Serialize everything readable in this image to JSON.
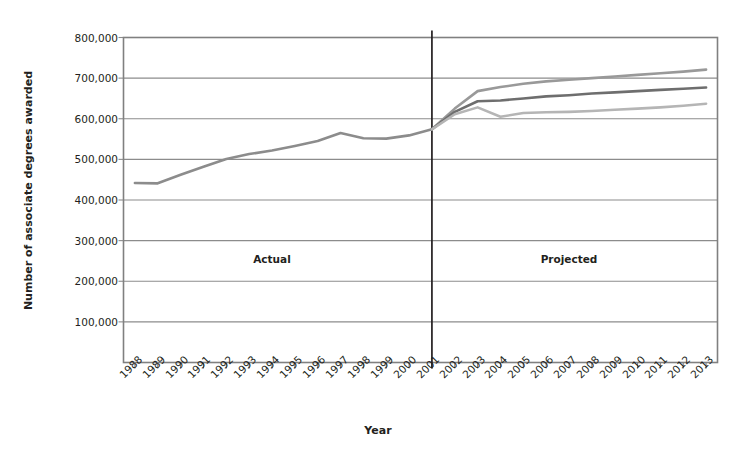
{
  "chart_data": {
    "type": "line",
    "title": "",
    "xlabel": "Year",
    "ylabel": "Number of associate degrees awarded",
    "ylim": [
      0,
      800000
    ],
    "ytick_labels": [
      "800,000",
      "700,000",
      "600,000",
      "500,000",
      "400,000",
      "300,000",
      "200,000",
      "100,000"
    ],
    "ytick_values": [
      800000,
      700000,
      600000,
      500000,
      400000,
      300000,
      200000,
      100000
    ],
    "grid": "horizontal",
    "legend": "none",
    "categories": [
      "1988",
      "1989",
      "1990",
      "1991",
      "1992",
      "1993",
      "1994",
      "1995",
      "1996",
      "1997",
      "1998",
      "1999",
      "2000",
      "2001",
      "2002",
      "2003",
      "2004",
      "2005",
      "2006",
      "2007",
      "2008",
      "2009",
      "2010",
      "2011",
      "2012",
      "2013"
    ],
    "annotations": [
      {
        "text": "Actual",
        "x": "1994",
        "y": 255000
      },
      {
        "text": "Projected",
        "x": "2007",
        "y": 255000
      }
    ],
    "divider": {
      "x": "2001",
      "label": "actual-projected-divider"
    },
    "series": [
      {
        "name": "actual",
        "color": "#8c8c8c",
        "x": [
          "1988",
          "1989",
          "1990",
          "1991",
          "1992",
          "1993",
          "1994",
          "1995",
          "1996",
          "1997",
          "1998",
          "1999",
          "2000",
          "2001"
        ],
        "values": [
          442000,
          441000,
          462000,
          482000,
          501000,
          513000,
          522000,
          533000,
          545000,
          565000,
          552000,
          551000,
          559000,
          574000
        ]
      },
      {
        "name": "projected-high",
        "color": "#999999",
        "x": [
          "2001",
          "2002",
          "2003",
          "2004",
          "2005",
          "2006",
          "2007",
          "2008",
          "2009",
          "2010",
          "2011",
          "2012",
          "2013"
        ],
        "values": [
          574000,
          625000,
          668000,
          678000,
          686000,
          692000,
          696000,
          700000,
          704000,
          708000,
          712000,
          716000,
          721000
        ]
      },
      {
        "name": "projected-middle",
        "color": "#6e6e6e",
        "x": [
          "2001",
          "2002",
          "2003",
          "2004",
          "2005",
          "2006",
          "2007",
          "2008",
          "2009",
          "2010",
          "2011",
          "2012",
          "2013"
        ],
        "values": [
          574000,
          617000,
          643000,
          645000,
          650000,
          655000,
          658000,
          662000,
          665000,
          668000,
          671000,
          674000,
          677000
        ]
      },
      {
        "name": "projected-low",
        "color": "#b5b5b5",
        "x": [
          "2001",
          "2002",
          "2003",
          "2004",
          "2005",
          "2006",
          "2007",
          "2008",
          "2009",
          "2010",
          "2011",
          "2012",
          "2013"
        ],
        "values": [
          574000,
          611000,
          628000,
          605000,
          614000,
          616000,
          617000,
          619000,
          622000,
          625000,
          628000,
          632000,
          637000
        ]
      }
    ]
  },
  "plot": {
    "frame_color": "#808080",
    "gridline_color": "#8c8c8c",
    "divider_color": "#231f20",
    "background": "#ffffff"
  }
}
